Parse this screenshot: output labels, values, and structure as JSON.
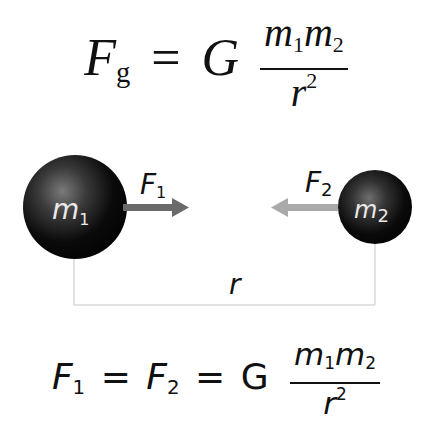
{
  "top_equation": {
    "lhs": "F",
    "lhs_sub": "g",
    "equals": "=",
    "constant": "G",
    "numerator": {
      "m1": "m",
      "m1_sub": "1",
      "m2": "m",
      "m2_sub": "2"
    },
    "denominator": {
      "base": "r",
      "exp": "2"
    }
  },
  "diagram": {
    "mass1": {
      "label": "m",
      "sub": "1"
    },
    "mass2": {
      "label": "m",
      "sub": "2"
    },
    "force1": {
      "label": "F",
      "sub": "1"
    },
    "force2": {
      "label": "F",
      "sub": "2"
    },
    "distance_label": "r",
    "colors": {
      "sphere": "#0a0a0a",
      "force1_arrow": "#6a6a6a",
      "force2_arrow": "#aaaaaa",
      "bracket": "#d8d8d8"
    }
  },
  "bottom_equation": {
    "f1": "F",
    "f1_sub": "1",
    "eq1": "=",
    "f2": "F",
    "f2_sub": "2",
    "eq2": "=",
    "constant": "G",
    "numerator": {
      "m1": "m",
      "m1_sub": "1",
      "m2": "m",
      "m2_sub": "2"
    },
    "denominator": {
      "base": "r",
      "exp": "2"
    }
  }
}
